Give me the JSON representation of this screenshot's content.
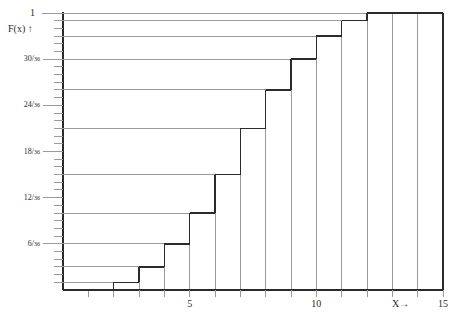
{
  "figure": {
    "kind": "step-plot",
    "axis_label_y": "F(x) ↑",
    "axis_label_y_top": "1",
    "axis_label_x": "X→",
    "line_color": "#2b2b2b",
    "grid_color": "#9a9a9a",
    "background": "#ffffff"
  },
  "y_axis": {
    "ticks_labeled": [
      {
        "value": 0.8333,
        "num": "30",
        "den": "36",
        "sep": "/"
      },
      {
        "value": 0.6667,
        "num": "24",
        "den": "36",
        "sep": "/"
      },
      {
        "value": 0.5,
        "num": "18",
        "den": "36",
        "sep": "/"
      },
      {
        "value": 0.3333,
        "num": "12",
        "den": "36",
        "sep": "/"
      },
      {
        "value": 0.1667,
        "num": "6",
        "den": "36",
        "sep": "/"
      }
    ],
    "minor_tick_step": 0.027777,
    "range": [
      0,
      1
    ]
  },
  "x_axis": {
    "range": [
      0,
      15
    ],
    "tick_step": 1,
    "labeled_ticks": [
      {
        "value": 5,
        "label": "5"
      },
      {
        "value": 10,
        "label": "10"
      },
      {
        "value": 15,
        "label": "15"
      }
    ],
    "arrow_label": {
      "value": 13.4,
      "label": "X→"
    }
  },
  "chart_data": {
    "type": "line",
    "title": "",
    "xlabel": "X→",
    "ylabel": "F(x) ↑",
    "xlim": [
      0,
      15
    ],
    "ylim": [
      0,
      1
    ],
    "grid": true,
    "legend": "none",
    "series": [
      {
        "name": "F(x) cumulative distribution of sum of two dice",
        "style": "step-post",
        "x": [
          2,
          3,
          4,
          5,
          6,
          7,
          8,
          9,
          10,
          11,
          12
        ],
        "y": [
          0.027778,
          0.083333,
          0.166667,
          0.277778,
          0.416667,
          0.583333,
          0.722222,
          0.833333,
          0.916667,
          0.972222,
          1.0
        ],
        "y_fractions": [
          "1/36",
          "3/36",
          "6/36",
          "10/36",
          "15/36",
          "21/36",
          "26/36",
          "30/36",
          "33/36",
          "35/36",
          "36/36"
        ]
      }
    ],
    "step_right_edge": 15,
    "vertical_rules_at_x": [
      1,
      2,
      3,
      4,
      5,
      6,
      7,
      8,
      9,
      10,
      11,
      12,
      13,
      14,
      15
    ]
  }
}
